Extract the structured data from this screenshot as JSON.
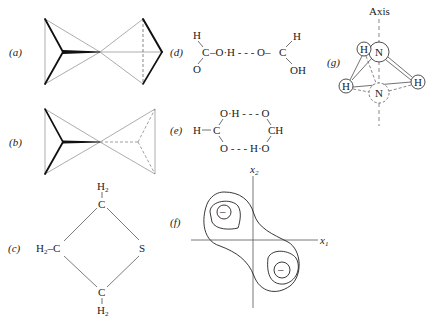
{
  "figure": {
    "panels": {
      "a": {
        "label": "(a)",
        "description": "two triangular-pyramid bow-tie geometry, solid bonds"
      },
      "b": {
        "label": "(b)",
        "description": "bow-tie geometry with dashed right-hand pyramid"
      },
      "c": {
        "label": "(c)",
        "atoms": {
          "top_h2": "H",
          "top_h2_sub": "2",
          "top_c": "C",
          "left_h2": "H",
          "left_h2_sub": "2",
          "left_bond": "–C",
          "right_s": "S",
          "bottom_c": "C",
          "bottom_h2": "H",
          "bottom_h2_sub": "2"
        }
      },
      "d": {
        "label": "(d)",
        "atoms": {
          "h1": "H",
          "c1": "C",
          "o1": "O",
          "bridge": "–O·H - - - O–",
          "c2": "C",
          "h2": "H",
          "oh2": "OH"
        }
      },
      "e": {
        "label": "(e)",
        "atoms": {
          "top": "O·H - - - O",
          "left_h": "H",
          "left_c": "C",
          "right_ch": "CH",
          "bottom": "O - - - H·O"
        }
      },
      "f": {
        "label": "(f)",
        "axis_x": "x",
        "axis_x_sub": "1",
        "axis_y": "x",
        "axis_y_sub": "2",
        "minus_upper": "–",
        "minus_lower": "–"
      },
      "g": {
        "label": "(g)",
        "axis_label": "Axis",
        "atoms": {
          "n_top": "N",
          "h_back": "H",
          "h_left": "H",
          "h_right": "H",
          "n_bottom": "N"
        }
      }
    },
    "colors": {
      "ink": "#222222",
      "light_line": "#999999",
      "background": "#ffffff"
    }
  }
}
